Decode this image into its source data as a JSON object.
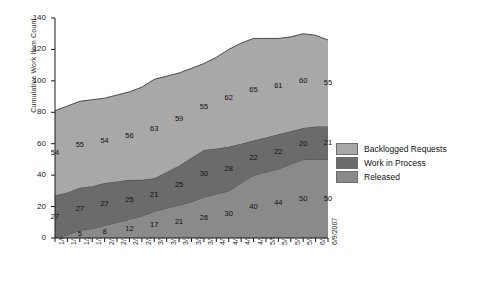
{
  "chart_data": {
    "type": "area",
    "stacked": true,
    "title": "",
    "xlabel": "",
    "ylabel": "Cumulative Work Item Count",
    "ylim": [
      0,
      140
    ],
    "ytick_step": 20,
    "yticks": [
      "0",
      "20",
      "40",
      "60",
      "80",
      "100",
      "120",
      "140"
    ],
    "grid": false,
    "legend_position": "right",
    "categories": [
      "1/6/2007",
      "1/13/2007",
      "1/20/2007",
      "1/27/2007",
      "2/3/2007",
      "2/10/2007",
      "2/17/2007",
      "2/24/2007",
      "3/3/2007",
      "3/10/2007",
      "3/17/2007",
      "3/24/2007",
      "3/31/2007",
      "4/7/2007",
      "4/14/2007",
      "4/21/2007",
      "4/28/2007",
      "5/5/2007",
      "5/12/2007",
      "5/19/2007",
      "5/26/2007",
      "6/2/2007",
      "6/9/2007"
    ],
    "series": [
      {
        "name": "Released",
        "color": "#8a8a8a",
        "stack_order": 0,
        "values": [
          0,
          2,
          5,
          6,
          8,
          10,
          12,
          14,
          17,
          19,
          21,
          23,
          26,
          28,
          30,
          35,
          40,
          42,
          44,
          47,
          50,
          50,
          50
        ],
        "labels": [
          {
            "index": 2,
            "value": 5
          },
          {
            "index": 4,
            "value": 8
          },
          {
            "index": 6,
            "value": 12
          },
          {
            "index": 8,
            "value": 17
          },
          {
            "index": 10,
            "value": 21
          },
          {
            "index": 12,
            "value": 26
          },
          {
            "index": 14,
            "value": 30
          },
          {
            "index": 16,
            "value": 40
          },
          {
            "index": 18,
            "value": 44
          },
          {
            "index": 20,
            "value": 50
          },
          {
            "index": 22,
            "value": 50
          }
        ]
      },
      {
        "name": "Work in Process",
        "color": "#6b6b6b",
        "stack_order": 1,
        "values": [
          27,
          27,
          27,
          27,
          27,
          26,
          25,
          23,
          21,
          23,
          25,
          28,
          30,
          29,
          28,
          25,
          22,
          22,
          22,
          21,
          20,
          21,
          21
        ],
        "labels": [
          {
            "index": 0,
            "value": 27
          },
          {
            "index": 2,
            "value": 27
          },
          {
            "index": 4,
            "value": 27
          },
          {
            "index": 6,
            "value": 25
          },
          {
            "index": 8,
            "value": 21
          },
          {
            "index": 10,
            "value": 25
          },
          {
            "index": 12,
            "value": 30
          },
          {
            "index": 14,
            "value": 28
          },
          {
            "index": 16,
            "value": 22
          },
          {
            "index": 18,
            "value": 22
          },
          {
            "index": 20,
            "value": 20
          },
          {
            "index": 22,
            "value": 21
          }
        ]
      },
      {
        "name": "Backlogged Requests",
        "color": "#a8a8a8",
        "stack_order": 2,
        "values": [
          54,
          55,
          55,
          55,
          54,
          55,
          56,
          59,
          63,
          61,
          59,
          57,
          55,
          58,
          62,
          64,
          65,
          63,
          61,
          60,
          60,
          58,
          55
        ],
        "labels": [
          {
            "index": 0,
            "value": 54
          },
          {
            "index": 2,
            "value": 55
          },
          {
            "index": 4,
            "value": 54
          },
          {
            "index": 6,
            "value": 56
          },
          {
            "index": 8,
            "value": 63
          },
          {
            "index": 10,
            "value": 59
          },
          {
            "index": 12,
            "value": 55
          },
          {
            "index": 14,
            "value": 62
          },
          {
            "index": 16,
            "value": 65
          },
          {
            "index": 18,
            "value": 61
          },
          {
            "index": 20,
            "value": 60
          },
          {
            "index": 22,
            "value": 55
          }
        ]
      }
    ],
    "legend_entries": [
      {
        "label": "Backlogged Requests",
        "color": "#a8a8a8"
      },
      {
        "label": "Work in Process",
        "color": "#6b6b6b"
      },
      {
        "label": "Released",
        "color": "#8a8a8a"
      }
    ]
  }
}
